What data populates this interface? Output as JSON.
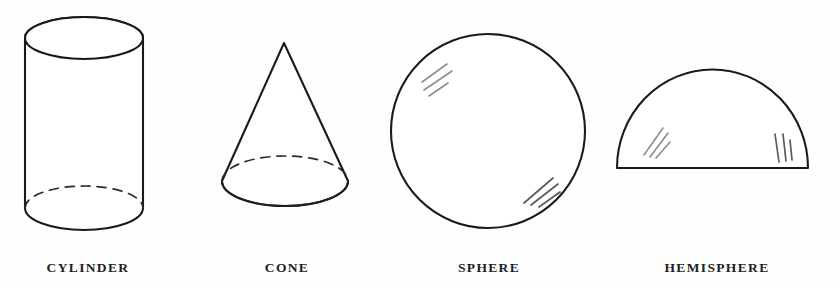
{
  "plate": {
    "title": "Geometric Solids Figure Plate",
    "background_color": "#fefefe",
    "ink_color": "#1a1a1a",
    "highlight_color": "#8d8d8d",
    "width": 840,
    "height": 288
  },
  "figures": [
    {
      "id": "cylinder",
      "label": "CYLINDER",
      "shape_type": "cylinder",
      "label_center_x": 88,
      "label_baseline_y": 272,
      "geometry": {
        "center_x": 84,
        "radius_x": 59,
        "top_ellipse_center_y": 38,
        "top_ellipse_radius_y": 21,
        "bottom_ellipse_center_y": 208,
        "bottom_ellipse_radius_y": 22,
        "left_edge_x": 25,
        "right_edge_x": 143
      },
      "hidden_edges": "dashed back half of bottom ellipse",
      "highlights": 0
    },
    {
      "id": "cone",
      "label": "CONE",
      "shape_type": "cone",
      "label_center_x": 287,
      "label_baseline_y": 272,
      "geometry": {
        "apex_x": 284,
        "apex_y": 43,
        "base_center_x": 285,
        "base_center_y": 186,
        "base_radius_x": 63,
        "base_radius_y": 25,
        "left_edge_x": 222,
        "right_edge_x": 348
      },
      "hidden_edges": "dashed back half of base ellipse",
      "highlights": 0
    },
    {
      "id": "sphere",
      "label": "SPHERE",
      "shape_type": "sphere",
      "label_center_x": 489,
      "label_baseline_y": 272,
      "geometry": {
        "center_x": 488,
        "center_y": 131,
        "radius": 97
      },
      "hidden_edges": "none",
      "highlights": 6,
      "highlight_groups": [
        {
          "position": "upper-left",
          "stroke_count": 3
        },
        {
          "position": "lower-right",
          "stroke_count": 3
        }
      ]
    },
    {
      "id": "hemisphere",
      "label": "HEMISPHERE",
      "shape_type": "hemisphere",
      "label_center_x": 717,
      "label_baseline_y": 272,
      "geometry": {
        "center_x": 712,
        "base_y": 168,
        "radius_x": 95,
        "radius_y": 98,
        "left_edge_x": 617,
        "right_edge_x": 808,
        "apex_y": 70
      },
      "hidden_edges": "none",
      "highlights": 6,
      "highlight_groups": [
        {
          "position": "upper-left",
          "stroke_count": 3
        },
        {
          "position": "right",
          "stroke_count": 3
        }
      ]
    }
  ]
}
